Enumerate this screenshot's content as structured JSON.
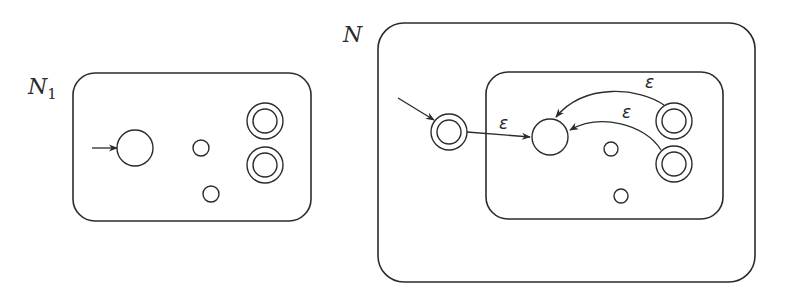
{
  "figure": {
    "panels": [
      {
        "id": "N1",
        "label_main": "N",
        "label_sub": "1",
        "box": {
          "x": 73,
          "y": 73,
          "w": 238,
          "h": 148,
          "r": 22
        },
        "start_arrow": {
          "x1": 92,
          "y1": 148,
          "x2": 117,
          "y2": 148
        },
        "states": [
          {
            "name": "start-state",
            "cx": 135,
            "cy": 148,
            "r": 18,
            "accept": false
          },
          {
            "name": "state",
            "cx": 201,
            "cy": 148,
            "r": 8,
            "accept": false
          },
          {
            "name": "state",
            "cx": 211,
            "cy": 194,
            "r": 8,
            "accept": false
          },
          {
            "name": "accept-state",
            "cx": 265,
            "cy": 121,
            "r": 18,
            "accept": true
          },
          {
            "name": "accept-state",
            "cx": 265,
            "cy": 165,
            "r": 18,
            "accept": true
          }
        ]
      },
      {
        "id": "N",
        "label_main": "N",
        "label_sub": "",
        "outer_box": {
          "x": 378,
          "y": 23,
          "w": 377,
          "h": 259,
          "r": 26
        },
        "inner_box": {
          "x": 486,
          "y": 72,
          "w": 237,
          "h": 147,
          "r": 22
        },
        "start_arrow": {
          "x1": 398,
          "y1": 98,
          "x2": 434,
          "y2": 120
        },
        "states": [
          {
            "name": "new-start-accept-state",
            "cx": 449,
            "cy": 132,
            "r": 18,
            "accept": true
          },
          {
            "name": "old-start-state",
            "cx": 550,
            "cy": 137,
            "r": 18,
            "accept": false
          },
          {
            "name": "state",
            "cx": 611,
            "cy": 149,
            "r": 7,
            "accept": false
          },
          {
            "name": "state",
            "cx": 621,
            "cy": 196,
            "r": 7,
            "accept": false
          },
          {
            "name": "accept-state",
            "cx": 674,
            "cy": 121,
            "r": 18,
            "accept": true
          },
          {
            "name": "accept-state",
            "cx": 674,
            "cy": 164,
            "r": 18,
            "accept": true
          }
        ],
        "edges": [
          {
            "name": "epsilon-edge-start",
            "label": "ε",
            "path": "M 467 132 L 530 137",
            "label_x": 499,
            "label_y": 129
          },
          {
            "name": "epsilon-edge-accept1",
            "label": "ε",
            "path": "M 664 105 C 640 88, 585 82, 556 117",
            "label_x": 645,
            "label_y": 88
          },
          {
            "name": "epsilon-edge-accept2",
            "label": "ε",
            "path": "M 661 150 C 645 124, 600 113, 570 130",
            "label_x": 622,
            "label_y": 118
          }
        ]
      }
    ]
  }
}
